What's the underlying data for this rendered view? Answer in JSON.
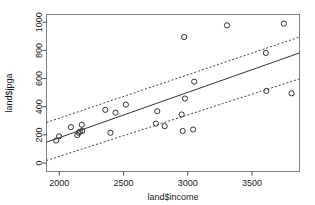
{
  "chart_data": {
    "type": "scatter",
    "title": "",
    "xlabel": "land$income",
    "ylabel": "land$jpga",
    "xlim": [
      1900,
      3870
    ],
    "ylim": [
      -60,
      1055
    ],
    "grid": false,
    "legend": "none",
    "xticks": [
      2000,
      2500,
      3000,
      3500
    ],
    "yticks": [
      0,
      200,
      400,
      600,
      800,
      1000
    ],
    "xtick_labels": [
      "2000",
      "2500",
      "3000",
      "3500"
    ],
    "ytick_labels": [
      "0",
      "200",
      "400",
      "600",
      "800",
      "1000"
    ],
    "marker": "open-circle",
    "points": [
      {
        "x": 1975,
        "y": 160
      },
      {
        "x": 1998,
        "y": 190
      },
      {
        "x": 2090,
        "y": 255
      },
      {
        "x": 2140,
        "y": 198
      },
      {
        "x": 2150,
        "y": 215
      },
      {
        "x": 2160,
        "y": 222
      },
      {
        "x": 2175,
        "y": 272
      },
      {
        "x": 2178,
        "y": 228
      },
      {
        "x": 2358,
        "y": 378
      },
      {
        "x": 2398,
        "y": 215
      },
      {
        "x": 2438,
        "y": 358
      },
      {
        "x": 2518,
        "y": 415
      },
      {
        "x": 2752,
        "y": 280
      },
      {
        "x": 2762,
        "y": 368
      },
      {
        "x": 2820,
        "y": 262
      },
      {
        "x": 2952,
        "y": 345
      },
      {
        "x": 2960,
        "y": 228
      },
      {
        "x": 2972,
        "y": 895
      },
      {
        "x": 2978,
        "y": 458
      },
      {
        "x": 3042,
        "y": 238
      },
      {
        "x": 3050,
        "y": 578
      },
      {
        "x": 3305,
        "y": 978
      },
      {
        "x": 3608,
        "y": 782
      },
      {
        "x": 3612,
        "y": 512
      },
      {
        "x": 3748,
        "y": 990
      },
      {
        "x": 3808,
        "y": 495
      }
    ],
    "fit_line": {
      "label": "regression-line",
      "style": "solid",
      "x1": 1900,
      "y1": 148,
      "x2": 3870,
      "y2": 782
    },
    "upper_band": {
      "label": "upper-confidence-band",
      "style": "dashed",
      "x1": 1900,
      "y1": 288,
      "x2": 3870,
      "y2": 895
    },
    "lower_band": {
      "label": "lower-confidence-band",
      "style": "dashed",
      "x1": 1900,
      "y1": 18,
      "x2": 3870,
      "y2": 598
    }
  }
}
